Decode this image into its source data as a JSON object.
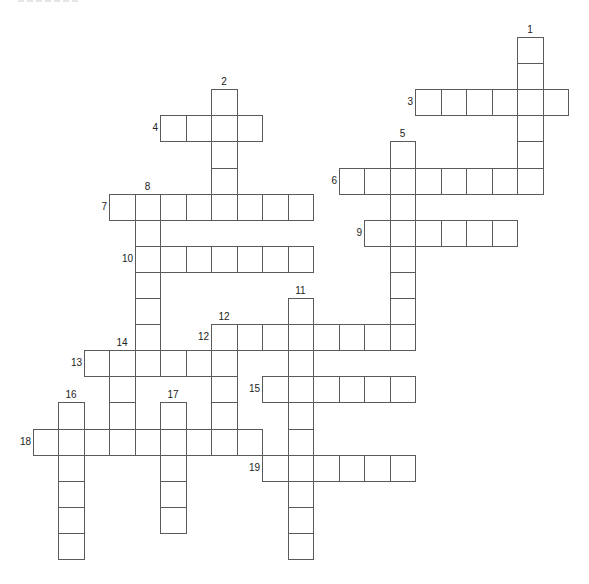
{
  "puzzle": {
    "type": "crossword",
    "grid": {
      "origin_x": 32.5,
      "origin_y": 37,
      "cell_w": 25.5,
      "cell_h": 26.1,
      "cols": 21,
      "rows": 20
    },
    "line_color": "#5a5a5a",
    "background": "#ffffff",
    "entries": [
      {
        "number": "1",
        "direction": "down",
        "col": 19,
        "row": 0,
        "length": 6,
        "label_pos": "top"
      },
      {
        "number": "2",
        "direction": "down",
        "col": 7,
        "row": 2,
        "length": 5,
        "label_pos": "top"
      },
      {
        "number": "3",
        "direction": "across",
        "col": 15,
        "row": 2,
        "length": 6,
        "label_pos": "left"
      },
      {
        "number": "4",
        "direction": "across",
        "col": 5,
        "row": 3,
        "length": 4,
        "label_pos": "left"
      },
      {
        "number": "5",
        "direction": "down",
        "col": 14,
        "row": 4,
        "length": 8,
        "label_pos": "top"
      },
      {
        "number": "6",
        "direction": "across",
        "col": 12,
        "row": 5,
        "length": 8,
        "label_pos": "left"
      },
      {
        "number": "7",
        "direction": "across",
        "col": 3,
        "row": 6,
        "length": 8,
        "label_pos": "left"
      },
      {
        "number": "8",
        "direction": "down",
        "col": 4,
        "row": 6,
        "length": 7,
        "label_pos": "top"
      },
      {
        "number": "9",
        "direction": "across",
        "col": 13,
        "row": 7,
        "length": 6,
        "label_pos": "left"
      },
      {
        "number": "10",
        "direction": "across",
        "col": 4,
        "row": 8,
        "length": 7,
        "label_pos": "left"
      },
      {
        "number": "11",
        "direction": "down",
        "col": 10,
        "row": 10,
        "length": 10,
        "label_pos": "top"
      },
      {
        "number": "12",
        "direction": "across",
        "col": 7,
        "row": 11,
        "length": 8,
        "label_pos": "left"
      },
      {
        "number": "12",
        "direction": "down",
        "col": 7,
        "row": 11,
        "length": 5,
        "label_pos": "top"
      },
      {
        "number": "13",
        "direction": "across",
        "col": 2,
        "row": 12,
        "length": 6,
        "label_pos": "left"
      },
      {
        "number": "14",
        "direction": "down",
        "col": 3,
        "row": 12,
        "length": 4,
        "label_pos": "top"
      },
      {
        "number": "15",
        "direction": "across",
        "col": 9,
        "row": 13,
        "length": 6,
        "label_pos": "left"
      },
      {
        "number": "16",
        "direction": "down",
        "col": 1,
        "row": 14,
        "length": 6,
        "label_pos": "top"
      },
      {
        "number": "17",
        "direction": "down",
        "col": 5,
        "row": 14,
        "length": 5,
        "label_pos": "top"
      },
      {
        "number": "18",
        "direction": "across",
        "col": 0,
        "row": 15,
        "length": 9,
        "label_pos": "left"
      },
      {
        "number": "19",
        "direction": "across",
        "col": 9,
        "row": 16,
        "length": 6,
        "label_pos": "left"
      }
    ]
  }
}
